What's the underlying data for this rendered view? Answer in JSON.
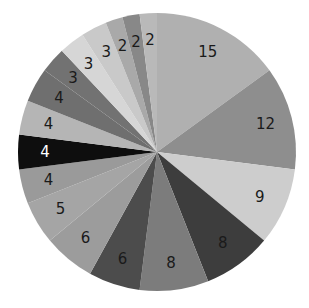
{
  "chart_data": {
    "type": "pie",
    "title": "",
    "start_angle": "12 o'clock",
    "direction": "clockwise",
    "legend": "none",
    "values": [
      15,
      12,
      9,
      8,
      8,
      6,
      6,
      5,
      4,
      4,
      4,
      4,
      3,
      3,
      3,
      2,
      2,
      2
    ],
    "labels": [
      "15",
      "12",
      "9",
      "8",
      "8",
      "6",
      "6",
      "5",
      "4",
      "4",
      "4",
      "4",
      "3",
      "3",
      "3",
      "2",
      "2",
      "2"
    ],
    "colors": [
      "#b0b0b0",
      "#8e8e8e",
      "#cdcdcd",
      "#3d3d3d",
      "#7c7c7c",
      "#4c4c4c",
      "#9c9c9c",
      "#a5a5a5",
      "#9a9a9a",
      "#0e0e0e",
      "#b5b5b5",
      "#6f6f6f",
      "#727272",
      "#d6d6d6",
      "#c9c9c9",
      "#a9a9a9",
      "#888888",
      "#b9b9b9"
    ],
    "label_colors": [
      "dark",
      "dark",
      "dark",
      "dark",
      "dark",
      "dark",
      "dark",
      "dark",
      "dark",
      "light",
      "dark",
      "dark",
      "dark",
      "dark",
      "dark",
      "dark",
      "dark",
      "dark"
    ],
    "total": 100
  }
}
